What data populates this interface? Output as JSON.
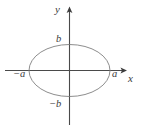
{
  "figure": {
    "background_color": "#ffffff",
    "axis_color": "#4a4a4a",
    "curve_color": "#808080",
    "label_color": "#3a3a3a",
    "width": 145,
    "height": 130
  },
  "axes": {
    "x_axis": {
      "label": "x",
      "arrow": "arrow-right"
    },
    "y_axis": {
      "label": "y",
      "arrow": "arrow-up"
    },
    "origin": {
      "x": 69.5,
      "y": 70.5
    }
  },
  "labels": {
    "semi_major_positive": "a",
    "semi_major_negative": "−a",
    "semi_minor_positive": "b",
    "semi_minor_negative": "−b"
  },
  "chart_data": {
    "type": "line",
    "title": "",
    "xlabel": "x",
    "ylabel": "y",
    "grid": false,
    "legend": null,
    "curves": [
      {
        "name": "ellipse",
        "equation": "x^2/a^2 + y^2/b^2 = 1",
        "center": [
          0,
          0
        ],
        "semi_axis_x": "a",
        "semi_axis_y": "b",
        "semi_axis_x_px": 40.5,
        "semi_axis_y_px": 26.0,
        "color": "#808080"
      }
    ],
    "annotations": [
      {
        "text": "a",
        "x": "a",
        "y": 0,
        "position": "below-left-of-vertex"
      },
      {
        "text": "−a",
        "x": "-a",
        "y": 0,
        "position": "below-left-of-vertex"
      },
      {
        "text": "b",
        "x": 0,
        "y": "b",
        "position": "left-of-vertex"
      },
      {
        "text": "−b",
        "x": 0,
        "y": "-b",
        "position": "left-of-vertex"
      }
    ],
    "xlim": [
      "-a",
      "a"
    ],
    "ylim": [
      "-b",
      "b"
    ]
  }
}
